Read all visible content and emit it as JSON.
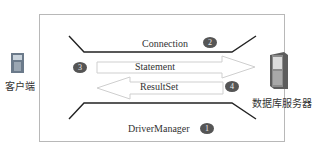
{
  "diagram": {
    "client": {
      "label": "客户端",
      "icon": "client-computer-icon"
    },
    "server": {
      "label": "数据库服务器",
      "icon": "database-server-icon"
    },
    "components": [
      {
        "name": "DriverManager",
        "step": "1"
      },
      {
        "name": "Connection",
        "step": "2"
      },
      {
        "name": "Statement",
        "step": "3",
        "direction": "client-to-server"
      },
      {
        "name": "ResultSet",
        "step": "4",
        "direction": "server-to-client"
      }
    ],
    "colors": {
      "badge": "#555555",
      "line": "#222222",
      "arrow_stroke": "#c8c8c8",
      "frame": "#b8b8b8"
    }
  }
}
